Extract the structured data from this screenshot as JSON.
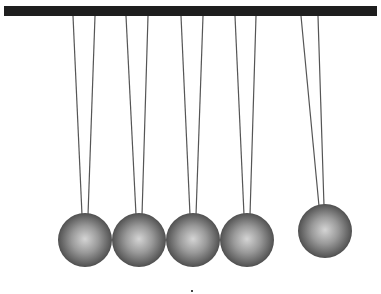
{
  "scene": {
    "title": "Newton's cradle",
    "bar": {
      "x": 4,
      "y": 6,
      "width": 373,
      "height": 10,
      "color": "#1e1e1e"
    },
    "string_color": "#555555",
    "balls": [
      {
        "id": 1,
        "cx": 85,
        "cy": 240,
        "r": 27,
        "string_left_top": 73,
        "string_right_top": 95,
        "string_left_bottom": 82,
        "string_right_bottom": 88
      },
      {
        "id": 2,
        "cx": 139,
        "cy": 240,
        "r": 27,
        "string_left_top": 126,
        "string_right_top": 148,
        "string_left_bottom": 136,
        "string_right_bottom": 142
      },
      {
        "id": 3,
        "cx": 193,
        "cy": 240,
        "r": 27,
        "string_left_top": 181,
        "string_right_top": 203,
        "string_left_bottom": 190,
        "string_right_bottom": 196
      },
      {
        "id": 4,
        "cx": 247,
        "cy": 240,
        "r": 27,
        "string_left_top": 235,
        "string_right_top": 256,
        "string_left_bottom": 244,
        "string_right_bottom": 250
      },
      {
        "id": 5,
        "cx": 325,
        "cy": 231,
        "r": 27,
        "string_left_top": 301,
        "string_right_top": 318,
        "string_left_bottom": 319,
        "string_right_bottom": 324
      }
    ]
  }
}
